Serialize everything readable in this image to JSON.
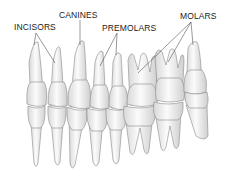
{
  "diagram": {
    "type": "anatomical-illustration",
    "labels": [
      {
        "id": "incisors",
        "text": "INCISORS"
      },
      {
        "id": "canines",
        "text": "CANINES"
      },
      {
        "id": "premolars",
        "text": "PREMOLARS"
      },
      {
        "id": "molars",
        "text": "MOLARS"
      }
    ],
    "colors": {
      "background": "#ffffff",
      "tooth_fill": "#f4f4f4",
      "tooth_stroke": "#8a8a8a",
      "text": "#222222",
      "leader_line": "#333333"
    }
  }
}
